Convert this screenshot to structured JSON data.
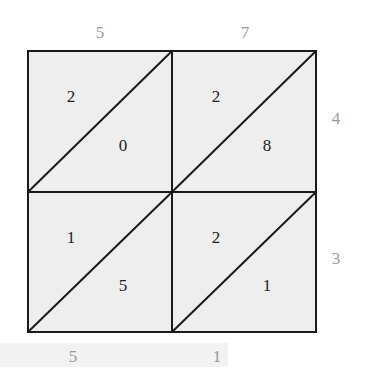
{
  "diagram": {
    "type": "lattice-multiplication",
    "top_digits": [
      "5",
      "7"
    ],
    "right_digits": [
      "4",
      "3"
    ],
    "cells": [
      {
        "row": 0,
        "col": 0,
        "tens": "2",
        "ones": "0"
      },
      {
        "row": 0,
        "col": 1,
        "tens": "2",
        "ones": "8"
      },
      {
        "row": 1,
        "col": 0,
        "tens": "1",
        "ones": "5"
      },
      {
        "row": 1,
        "col": 1,
        "tens": "2",
        "ones": "1"
      }
    ],
    "bottom_digits": [
      "5",
      "1"
    ],
    "colors": {
      "cell_fill": "#eeeeee",
      "grid_line": "#1a1a1a",
      "outer_digit": "#999999",
      "inner_digit": "#222222",
      "bottom_strip": "#f2f2f2"
    }
  }
}
